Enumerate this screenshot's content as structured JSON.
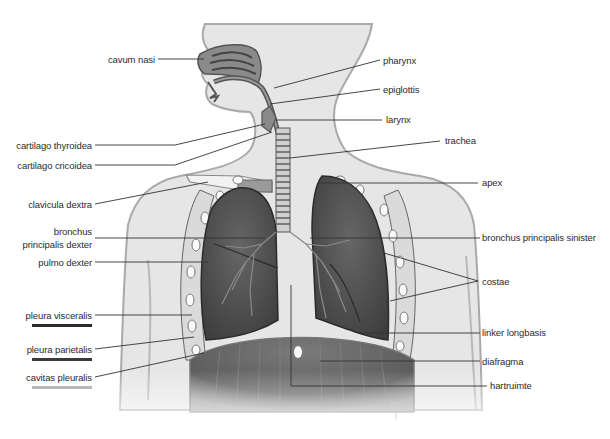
{
  "diagram": {
    "colors": {
      "body": "#e6e6e6",
      "body_outline": "#a9a9a9",
      "lung": "#5a5a5a",
      "lung_dark": "#3c3c3c",
      "airway": "#8a8a8a",
      "diaphragm": "#6e6e6e",
      "leader_line": "#333333",
      "pleura_visceralis_line": "#2b2b2b",
      "pleura_parietalis_line": "#3a3a3a",
      "cavitas_pleuralis_line": "#b8b8b8"
    },
    "labels_left": [
      {
        "id": "cavum-nasi",
        "text": "cavum nasi"
      },
      {
        "id": "cartilago-thyroidea",
        "text": "cartilago thyroidea"
      },
      {
        "id": "cartilago-cricoidea",
        "text": "cartilago cricoidea"
      },
      {
        "id": "clavicula-dextra",
        "text": "clavicula dextra"
      },
      {
        "id": "bronchus-principalis-dexter-1",
        "text": "bronchus"
      },
      {
        "id": "bronchus-principalis-dexter-2",
        "text": "principalis dexter"
      },
      {
        "id": "pulmo-dexter",
        "text": "pulmo dexter"
      },
      {
        "id": "pleura-visceralis",
        "text": "pleura visceralis"
      },
      {
        "id": "pleura-parietalis",
        "text": "pleura parietalis"
      },
      {
        "id": "cavitas-pleuralis",
        "text": "cavitas pleuralis"
      }
    ],
    "labels_right": [
      {
        "id": "pharynx",
        "text": "pharynx"
      },
      {
        "id": "epiglottis",
        "text": "epiglottis"
      },
      {
        "id": "larynx",
        "text": "larynx"
      },
      {
        "id": "trachea",
        "text": "trachea"
      },
      {
        "id": "apex",
        "text": "apex"
      },
      {
        "id": "bronchus-principalis-sinister",
        "text": "bronchus principalis sinister"
      },
      {
        "id": "costae",
        "text": "costae"
      },
      {
        "id": "linker-longbasis",
        "text": "linker longbasis"
      },
      {
        "id": "diafragma",
        "text": "diafragma"
      },
      {
        "id": "hartruimte",
        "text": "hartruimte"
      }
    ]
  }
}
